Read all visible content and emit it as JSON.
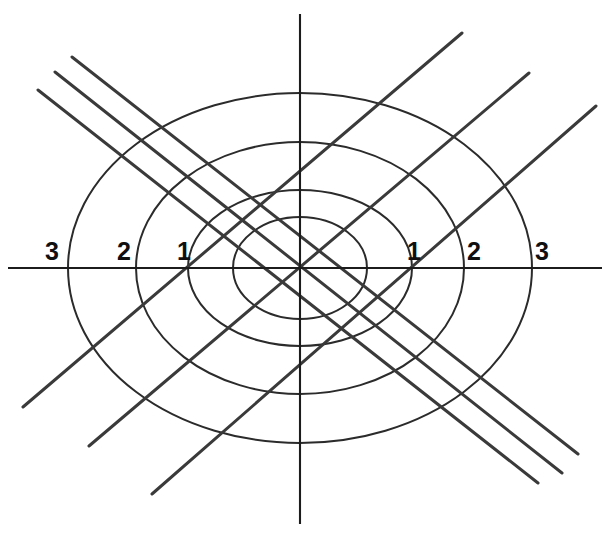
{
  "figure": {
    "background_color": "#ffffff",
    "width": 610,
    "height": 537
  },
  "style": {
    "axis_color": "#1c1c1c",
    "ellipse_color": "#2b2b2b",
    "diagonal_color": "#3a3a3a",
    "label_color": "#101010",
    "axis_stroke_width": 2.1,
    "ellipse_stroke_width": 2.0,
    "diagonal_stroke_width": 3.0
  },
  "chart_data": {
    "type": "line",
    "xlabel": "",
    "ylabel": "",
    "grid": false,
    "legend": "none",
    "origin_px": {
      "x": 300,
      "y": 268
    },
    "axes": [
      {
        "name": "x-axis",
        "orientation": "horizontal",
        "x1": 8,
        "y1": 268,
        "x2": 602,
        "y2": 268
      },
      {
        "name": "y-axis",
        "orientation": "vertical",
        "x1": 300,
        "y1": 14,
        "x2": 300,
        "y2": 524
      }
    ],
    "tick_labels": [
      {
        "text": "3",
        "axis": "x",
        "value": -3,
        "x": 52,
        "y": 260
      },
      {
        "text": "2",
        "axis": "x",
        "value": -2,
        "x": 124,
        "y": 260
      },
      {
        "text": "1",
        "axis": "x",
        "value": -1,
        "x": 184,
        "y": 260
      },
      {
        "text": "1",
        "axis": "x",
        "value": 1,
        "x": 414,
        "y": 260
      },
      {
        "text": "2",
        "axis": "x",
        "value": 2,
        "x": 474,
        "y": 260
      },
      {
        "text": "3",
        "axis": "x",
        "value": 3,
        "x": 542,
        "y": 260
      }
    ],
    "ellipses": [
      {
        "name": "level-curve-1",
        "level": 1,
        "cx": 300,
        "cy": 268,
        "rx": 67,
        "ry": 51,
        "x_intercepts": [
          -0.77,
          0.77
        ],
        "y_intercepts": [
          -0.29,
          0.29
        ]
      },
      {
        "name": "level-curve-2",
        "level": 2,
        "cx": 300,
        "cy": 268,
        "rx": 112,
        "ry": 78,
        "x_intercepts": [
          -1.29,
          1.29
        ],
        "y_intercepts": [
          -0.45,
          0.45
        ]
      },
      {
        "name": "level-curve-3",
        "level": 3,
        "cx": 300,
        "cy": 268,
        "rx": 164,
        "ry": 126,
        "x_intercepts": [
          -1.89,
          1.89
        ],
        "y_intercepts": [
          -0.72,
          0.72
        ]
      },
      {
        "name": "level-curve-4",
        "level": 4,
        "cx": 300,
        "cy": 268,
        "rx": 232,
        "ry": 175,
        "x_intercepts": [
          -2.67,
          2.67
        ],
        "y_intercepts": [
          -1.01,
          1.01
        ]
      }
    ],
    "lines": [
      {
        "name": "diagonal-down-1",
        "slope_sign": "negative",
        "x1": 72,
        "y1": 57,
        "x2": 578,
        "y2": 454
      },
      {
        "name": "diagonal-down-2",
        "slope_sign": "negative",
        "x1": 55,
        "y1": 72,
        "x2": 562,
        "y2": 473
      },
      {
        "name": "diagonal-down-3",
        "slope_sign": "negative",
        "x1": 38,
        "y1": 90,
        "x2": 538,
        "y2": 483
      },
      {
        "name": "diagonal-up-1",
        "slope_sign": "positive",
        "x1": 23,
        "y1": 407,
        "x2": 462,
        "y2": 33
      },
      {
        "name": "diagonal-up-2",
        "slope_sign": "positive",
        "x1": 89,
        "y1": 446,
        "x2": 529,
        "y2": 73
      },
      {
        "name": "diagonal-up-3",
        "slope_sign": "positive",
        "x1": 152,
        "y1": 494,
        "x2": 596,
        "y2": 106
      }
    ],
    "counts": {
      "ellipse_count": 4,
      "diagonal_line_count": 6,
      "axis_count": 2,
      "tick_label_count": 6
    }
  }
}
